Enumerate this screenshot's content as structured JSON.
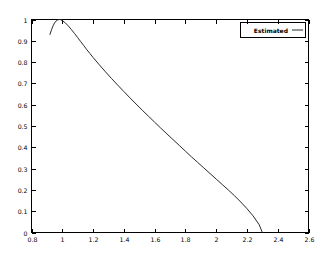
{
  "chart_data": {
    "type": "line",
    "title": "",
    "xlabel": "",
    "ylabel": "",
    "xlim": [
      0.8,
      2.6
    ],
    "ylim": [
      0,
      1
    ],
    "grid": false,
    "legend_position": "top-right-inside",
    "xticks": [
      "0.8",
      "1",
      "1.2",
      "1.4",
      "1.6",
      "1.8",
      "2",
      "2.2",
      "2.4",
      "2.6"
    ],
    "xtick_values": [
      0.8,
      1.0,
      1.2,
      1.4,
      1.6,
      1.8,
      2.0,
      2.2,
      2.4,
      2.6
    ],
    "yticks": [
      "0",
      "0.1",
      "0.2",
      "0.3",
      "0.4",
      "0.5",
      "0.6",
      "0.7",
      "0.8",
      "0.9",
      "1"
    ],
    "ytick_values": [
      0,
      0.1,
      0.2,
      0.3,
      0.4,
      0.5,
      0.6,
      0.7,
      0.8,
      0.9,
      1.0
    ],
    "series": [
      {
        "name": "Estimated",
        "color": "#2a2a2a",
        "x": [
          0.92,
          0.93,
          0.94,
          0.95,
          0.96,
          0.97,
          0.98,
          0.99,
          1.0,
          1.02,
          1.04,
          1.06,
          1.08,
          1.1,
          1.12,
          1.14,
          1.16,
          1.18,
          1.2,
          1.24,
          1.28,
          1.32,
          1.36,
          1.4,
          1.44,
          1.48,
          1.52,
          1.56,
          1.6,
          1.64,
          1.68,
          1.72,
          1.76,
          1.8,
          1.84,
          1.88,
          1.92,
          1.96,
          2.0,
          2.04,
          2.08,
          2.12,
          2.16,
          2.2,
          2.24,
          2.28,
          2.3
        ],
        "y": [
          0.93,
          0.952,
          0.97,
          0.984,
          0.993,
          0.998,
          1.0,
          0.999,
          0.995,
          0.984,
          0.969,
          0.952,
          0.934,
          0.915,
          0.896,
          0.877,
          0.858,
          0.84,
          0.822,
          0.788,
          0.755,
          0.723,
          0.692,
          0.662,
          0.632,
          0.603,
          0.574,
          0.546,
          0.518,
          0.49,
          0.463,
          0.436,
          0.409,
          0.382,
          0.355,
          0.329,
          0.303,
          0.277,
          0.251,
          0.225,
          0.199,
          0.172,
          0.143,
          0.112,
          0.078,
          0.036,
          0.0
        ]
      }
    ],
    "legend_entries": [
      {
        "label": "Estimated",
        "color": "#2a2a2a",
        "marker": "line"
      }
    ]
  },
  "colors": {
    "background": "#ffffff",
    "axis": "#000000",
    "series": "#2a2a2a"
  }
}
